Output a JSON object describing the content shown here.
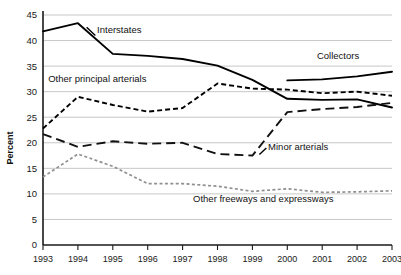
{
  "chart_data": {
    "type": "line",
    "title": "",
    "xlabel": "",
    "ylabel": "Percent",
    "x": [
      1993,
      1994,
      1995,
      1996,
      1997,
      1998,
      1999,
      2000,
      2001,
      2002,
      2003
    ],
    "xticklabels": [
      "1993",
      "1994",
      "1995",
      "1996",
      "1997",
      "1998",
      "1999",
      "2000",
      "2001",
      "2002",
      "2003"
    ],
    "yticklabels": [
      "0",
      "5",
      "10",
      "15",
      "20",
      "25",
      "30",
      "35",
      "40",
      "45"
    ],
    "ylim": [
      0,
      45
    ],
    "ytick_step": 5,
    "grid": true,
    "legend_position": "inline-annotations",
    "series": [
      {
        "name": "Interstates",
        "style": "solid",
        "color": "#000000",
        "values": [
          41.8,
          43.4,
          37.4,
          37.0,
          36.4,
          35.1,
          32.3,
          28.6,
          28.4,
          28.5,
          26.9
        ],
        "label_x": 1994.55,
        "label_y": 41.4
      },
      {
        "name": "Other principal arterials",
        "style": "short-dash",
        "color": "#000000",
        "values": [
          22.8,
          29.0,
          27.4,
          26.1,
          26.8,
          31.6,
          30.6,
          30.4,
          29.7,
          30.0,
          29.2
        ],
        "label_x": 1993.15,
        "label_y": 31.8
      },
      {
        "name": "Minor arterials",
        "style": "long-dash",
        "color": "#111111",
        "values": [
          21.7,
          19.2,
          20.3,
          19.8,
          20.0,
          17.8,
          17.5,
          26.0,
          26.6,
          27.0,
          27.8
        ],
        "label_x": 1999.45,
        "label_y": 18.5
      },
      {
        "name": "Other freeways and expressways",
        "style": "dotted",
        "color": "#8f8f8f",
        "values": [
          13.3,
          17.8,
          15.4,
          12.0,
          12.0,
          11.5,
          10.5,
          11.0,
          10.3,
          10.4,
          10.6
        ],
        "label_x": 1997.3,
        "label_y": 8.4
      },
      {
        "name": "Collectors",
        "style": "solid-right",
        "color": "#000000",
        "values": [
          null,
          null,
          null,
          null,
          null,
          null,
          null,
          32.2,
          32.4,
          33.0,
          33.9
        ],
        "label_x": 2000.85,
        "label_y": 36.3
      }
    ],
    "annotations": [
      {
        "text": "Interstates",
        "series": "Interstates"
      },
      {
        "text": "Other principal arterials",
        "series": "Other principal arterials"
      },
      {
        "text": "Minor arterials",
        "series": "Minor arterials"
      },
      {
        "text": "Other freeways and expressways",
        "series": "Other freeways and expressways"
      },
      {
        "text": "Collectors",
        "series": "Collectors"
      }
    ]
  },
  "axis": {
    "y_title": "Percent",
    "y_ticks": [
      "45",
      "40",
      "35",
      "30",
      "25",
      "20",
      "15",
      "10",
      "5",
      "0"
    ],
    "x_ticks": [
      "1993",
      "1994",
      "1995",
      "1996",
      "1997",
      "1998",
      "1999",
      "2000",
      "2001",
      "2002",
      "2003"
    ]
  },
  "labels": {
    "interstates": "Interstates",
    "other_principal_arterials": "Other principal arterials",
    "minor_arterials": "Minor arterials",
    "other_freeways": "Other freeways and expressways",
    "collectors": "Collectors"
  }
}
